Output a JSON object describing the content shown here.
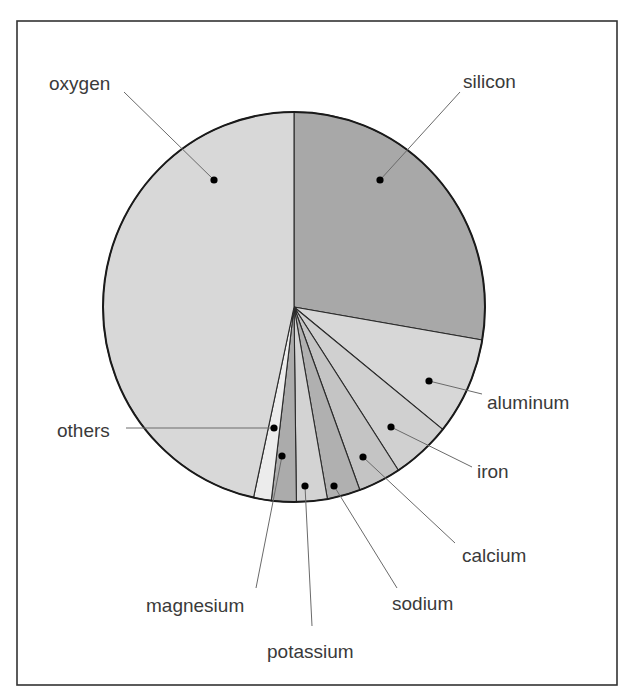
{
  "chart_data": {
    "type": "pie",
    "title": "",
    "start_angle_deg": 0,
    "direction": "clockwise",
    "categories": [
      "silicon",
      "aluminum",
      "iron",
      "calcium",
      "sodium",
      "potassium",
      "magnesium",
      "others",
      "oxygen"
    ],
    "values": [
      27.7,
      8.1,
      5.0,
      3.6,
      2.8,
      2.6,
      2.1,
      1.5,
      46.6
    ],
    "unit": "%",
    "colors": [
      "#a8a8a8",
      "#d7d7d7",
      "#d0d0d0",
      "#c4c4c4",
      "#b0b0b0",
      "#d3d3d3",
      "#ababab",
      "#ececec",
      "#d8d8d8"
    ],
    "legend": "none (callout labels with leader lines)",
    "slices": [
      {
        "label": "silicon",
        "value": 27.7,
        "color": "#a8a8a8",
        "dot": [
          380,
          180
        ],
        "label_pos": [
          463,
          88
        ],
        "anchor": "start",
        "leader_end": [
          460,
          92
        ]
      },
      {
        "label": "aluminum",
        "value": 8.1,
        "color": "#d7d7d7",
        "dot": [
          429,
          381
        ],
        "label_pos": [
          487,
          409
        ],
        "anchor": "start",
        "leader_end": [
          482,
          394
        ]
      },
      {
        "label": "iron",
        "value": 5.0,
        "color": "#d0d0d0",
        "dot": [
          391,
          427
        ],
        "label_pos": [
          477,
          478
        ],
        "anchor": "start",
        "leader_end": [
          472,
          467
        ]
      },
      {
        "label": "calcium",
        "value": 3.6,
        "color": "#c4c4c4",
        "dot": [
          363,
          457
        ],
        "label_pos": [
          462,
          562
        ],
        "anchor": "start",
        "leader_end": [
          455,
          543
        ]
      },
      {
        "label": "sodium",
        "value": 2.8,
        "color": "#b0b0b0",
        "dot": [
          334,
          486
        ],
        "label_pos": [
          392,
          610
        ],
        "anchor": "start",
        "leader_end": [
          397,
          588
        ]
      },
      {
        "label": "potassium",
        "value": 2.6,
        "color": "#d3d3d3",
        "dot": [
          305,
          486
        ],
        "label_pos": [
          267,
          658
        ],
        "anchor": "start",
        "leader_end": [
          312,
          626
        ]
      },
      {
        "label": "magnesium",
        "value": 2.1,
        "color": "#ababab",
        "dot": [
          282,
          456
        ],
        "label_pos": [
          146,
          612
        ],
        "anchor": "start",
        "leader_end": [
          256,
          588
        ]
      },
      {
        "label": "others",
        "value": 1.5,
        "color": "#ececec",
        "dot": [
          274,
          428
        ],
        "label_pos": [
          57,
          437
        ],
        "anchor": "start",
        "leader_end": [
          126,
          428
        ]
      },
      {
        "label": "oxygen",
        "value": 46.6,
        "color": "#d8d8d8",
        "dot": [
          214,
          180
        ],
        "label_pos": [
          49,
          90
        ],
        "anchor": "start",
        "leader_end": [
          124,
          92
        ]
      }
    ]
  },
  "layout": {
    "frame": {
      "x": 17,
      "y": 21,
      "w": 600,
      "h": 664
    },
    "pie": {
      "cx": 294,
      "cy": 307,
      "rx": 191,
      "ry": 195
    }
  }
}
